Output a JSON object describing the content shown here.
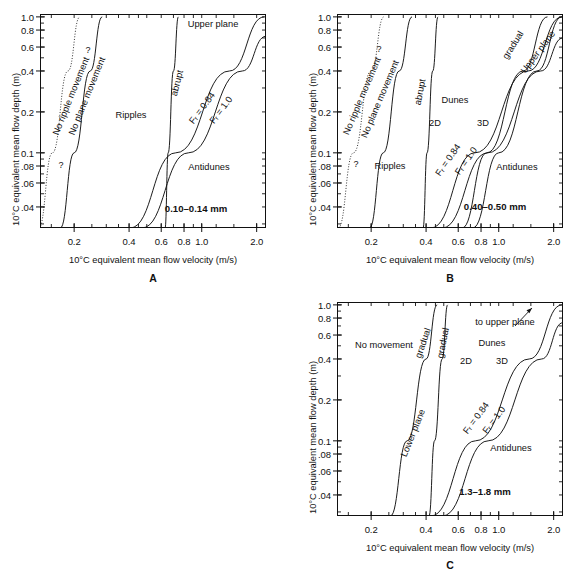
{
  "figure": {
    "type": "bedform-phase-diagrams",
    "panel_count": 3
  },
  "axes": {
    "ytitle": "10°C equivalent mean flow depth (m)",
    "xtitle": "10°C equivalent mean flow velocity (m/s)",
    "y_ticks": [
      "1.0",
      "0.8",
      "0.6",
      "0.4",
      "0.2",
      "0.1",
      ".08",
      ".06",
      ".04"
    ],
    "y_values": [
      1.0,
      0.8,
      0.6,
      0.4,
      0.2,
      0.1,
      0.08,
      0.06,
      0.04
    ],
    "x_ticks": [
      "0.2",
      "0.4",
      "0.6",
      "0.8",
      "1.0",
      "2.0"
    ],
    "x_values": [
      0.2,
      0.4,
      0.6,
      0.8,
      1.0,
      2.0
    ],
    "x_scale": "log",
    "y_scale": "log",
    "xlim": [
      0.13,
      2.25
    ],
    "ylim": [
      0.028,
      1.05
    ]
  },
  "panels": [
    {
      "id": "A",
      "name": "A",
      "grain_size": "0.10–0.14 mm",
      "regions": [
        {
          "label": "Upper plane",
          "x": 1.35,
          "y": 0.88
        },
        {
          "label": "Ripples",
          "x": 0.5,
          "y": 0.2
        },
        {
          "label": "Antidunes",
          "x": 1.25,
          "y": 0.063
        }
      ],
      "boundary_labels": [
        {
          "label": "No ripple movement",
          "style": "dotted",
          "rot": -68
        },
        {
          "label": "No plane movement",
          "style": "solid",
          "rot": -68
        },
        {
          "label": "abrupt",
          "style": "solid",
          "rot": -75
        },
        {
          "label": "Fᵣ = 0.84",
          "style": "solid",
          "rot": -52
        },
        {
          "label": "Fᵣ = 1.0",
          "style": "solid",
          "rot": -52
        }
      ],
      "query_marks": [
        "?",
        "?"
      ]
    },
    {
      "id": "B",
      "name": "B",
      "grain_size": "0.40–0.50 mm",
      "regions": [
        {
          "label": "Ripples",
          "x": 0.3,
          "y": 0.068
        },
        {
          "label": "Dunes",
          "x": 0.72,
          "y": 0.24
        },
        {
          "label": "2D",
          "x": 0.58,
          "y": 0.155
        },
        {
          "label": "3D",
          "x": 0.95,
          "y": 0.155
        },
        {
          "label": "Antidunes",
          "x": 1.45,
          "y": 0.068
        }
      ],
      "boundary_labels": [
        {
          "label": "No ripple movement",
          "style": "dotted",
          "rot": -67
        },
        {
          "label": "No plane movement",
          "style": "solid",
          "rot": -67
        },
        {
          "label": "abrupt",
          "style": "solid",
          "rot": -78
        },
        {
          "label": "gradual",
          "style": "solid",
          "rot": -57
        },
        {
          "label": "Upper plane",
          "style": "solid",
          "rot": -52
        },
        {
          "label": "Fᵣ = 0.84",
          "style": "solid",
          "rot": -55
        },
        {
          "label": "Fᵣ = 1.0",
          "style": "solid",
          "rot": -55
        }
      ],
      "query_marks": [
        "?",
        "?"
      ]
    },
    {
      "id": "C",
      "name": "C",
      "grain_size": "1.3–1.8 mm",
      "regions": [
        {
          "label": "No movement",
          "x": 0.25,
          "y": 0.43
        },
        {
          "label": "to upper plane",
          "x": 1.25,
          "y": 0.8
        },
        {
          "label": "Dunes",
          "x": 1.05,
          "y": 0.45
        },
        {
          "label": "2D",
          "x": 0.73,
          "y": 0.3
        },
        {
          "label": "3D",
          "x": 1.12,
          "y": 0.3
        },
        {
          "label": "Antidunes",
          "x": 1.45,
          "y": 0.06
        }
      ],
      "boundary_labels": [
        {
          "label": "gradual",
          "style": "solid",
          "rot": -70
        },
        {
          "label": "gradual",
          "style": "solid",
          "rot": -78
        },
        {
          "label": "Lower plane",
          "style": "solid",
          "rot": -68
        },
        {
          "label": "Fᵣ = 0.84",
          "style": "solid",
          "rot": -52
        },
        {
          "label": "Fᵣ = 1.0",
          "style": "solid",
          "rot": -52
        }
      ],
      "arrow": {
        "label": "to upper plane",
        "direction": "up-right"
      }
    }
  ],
  "chart_data": {
    "type": "line",
    "title": "",
    "xlabel": "10°C equivalent mean flow velocity (m/s)",
    "ylabel": "10°C equivalent mean flow depth (m)",
    "xlim": [
      0.13,
      2.25
    ],
    "ylim": [
      0.028,
      1.05
    ],
    "x_scale": "log",
    "y_scale": "log",
    "grid": false,
    "legend": "none",
    "panels": [
      {
        "panel": "A",
        "grain_size_mm": "0.10-0.14",
        "series": [
          {
            "name": "No ripple movement",
            "style": "dotted",
            "points": [
              [
                0.128,
                0.028
              ],
              [
                0.152,
                0.1
              ],
              [
                0.185,
                0.4
              ],
              [
                0.215,
                1.0
              ]
            ]
          },
          {
            "name": "No plane movement",
            "style": "solid",
            "points": [
              [
                0.168,
                0.028
              ],
              [
                0.2,
                0.1
              ],
              [
                0.245,
                0.4
              ],
              [
                0.285,
                1.0
              ]
            ]
          },
          {
            "name": "abrupt (ripples to upper plane)",
            "style": "solid",
            "points": [
              [
                0.63,
                0.028
              ],
              [
                0.655,
                0.1
              ],
              [
                0.7,
                0.4
              ],
              [
                0.745,
                1.0
              ]
            ]
          },
          {
            "name": "Fr = 0.84",
            "style": "solid",
            "points": [
              [
                0.405,
                0.028
              ],
              [
                0.72,
                0.1
              ],
              [
                1.42,
                0.4
              ],
              [
                2.2,
                1.0
              ]
            ]
          },
          {
            "name": "Fr = 1.0",
            "style": "solid",
            "points": [
              [
                0.47,
                0.028
              ],
              [
                0.845,
                0.1
              ],
              [
                1.67,
                0.4
              ],
              [
                2.25,
                0.72
              ]
            ]
          }
        ]
      },
      {
        "panel": "B",
        "grain_size_mm": "0.40-0.50",
        "series": [
          {
            "name": "No ripple movement",
            "style": "dotted",
            "points": [
              [
                0.132,
                0.028
              ],
              [
                0.16,
                0.1
              ],
              [
                0.2,
                0.4
              ],
              [
                0.235,
                1.0
              ]
            ]
          },
          {
            "name": "No plane movement",
            "style": "solid",
            "points": [
              [
                0.196,
                0.028
              ],
              [
                0.233,
                0.1
              ],
              [
                0.285,
                0.4
              ],
              [
                0.335,
                1.0
              ]
            ]
          },
          {
            "name": "abrupt (ripples to dunes)",
            "style": "solid",
            "points": [
              [
                0.385,
                0.028
              ],
              [
                0.405,
                0.1
              ],
              [
                0.435,
                0.4
              ],
              [
                0.465,
                1.0
              ]
            ]
          },
          {
            "name": "gradual (dunes to upper plane)",
            "style": "solid",
            "points": [
              [
                0.63,
                0.028
              ],
              [
                0.86,
                0.1
              ],
              [
                1.36,
                0.4
              ],
              [
                1.85,
                1.0
              ]
            ]
          },
          {
            "name": "Upper plane",
            "style": "solid",
            "points": [
              [
                0.72,
                0.028
              ],
              [
                1.0,
                0.1
              ],
              [
                1.62,
                0.4
              ],
              [
                2.22,
                1.0
              ]
            ]
          },
          {
            "name": "Fr = 0.84",
            "style": "solid",
            "points": [
              [
                0.425,
                0.028
              ],
              [
                0.74,
                0.1
              ],
              [
                1.45,
                0.4
              ],
              [
                2.22,
                1.0
              ]
            ]
          },
          {
            "name": "Fr = 1.0",
            "style": "solid",
            "points": [
              [
                0.49,
                0.028
              ],
              [
                0.87,
                0.1
              ],
              [
                1.7,
                0.4
              ],
              [
                2.25,
                0.7
              ]
            ]
          }
        ]
      },
      {
        "panel": "C",
        "grain_size_mm": "1.3-1.8",
        "series": [
          {
            "name": "gradual (no movement to lower plane)",
            "style": "solid",
            "points": [
              [
                0.255,
                0.028
              ],
              [
                0.315,
                0.1
              ],
              [
                0.4,
                0.4
              ],
              [
                0.46,
                1.0
              ]
            ]
          },
          {
            "name": "gradual (lower plane to dunes)",
            "style": "solid",
            "points": [
              [
                0.415,
                0.028
              ],
              [
                0.445,
                0.1
              ],
              [
                0.49,
                0.4
              ],
              [
                0.525,
                1.0
              ]
            ]
          },
          {
            "name": "Fr = 0.84",
            "style": "solid",
            "points": [
              [
                0.425,
                0.028
              ],
              [
                0.745,
                0.1
              ],
              [
                1.47,
                0.4
              ],
              [
                2.22,
                1.0
              ]
            ]
          },
          {
            "name": "Fr = 1.0",
            "style": "solid",
            "points": [
              [
                0.49,
                0.028
              ],
              [
                0.875,
                0.1
              ],
              [
                1.72,
                0.4
              ],
              [
                2.25,
                0.74
              ]
            ]
          }
        ]
      }
    ]
  }
}
